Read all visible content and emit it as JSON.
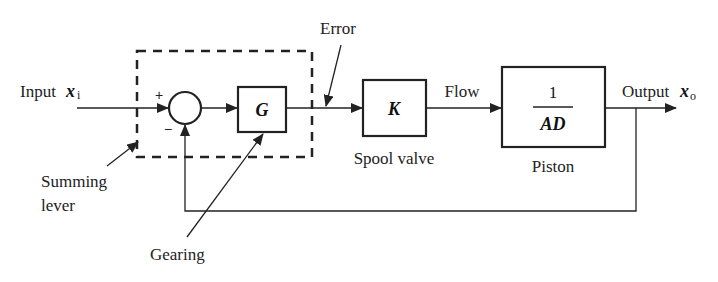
{
  "diagram": {
    "type": "block-diagram",
    "input": {
      "label": "Input",
      "symbol": "x",
      "subscript": "i"
    },
    "output": {
      "label": "Output",
      "symbol": "x",
      "subscript": "o"
    },
    "summing_junction": {
      "plus_sign": "+",
      "minus_sign": "−"
    },
    "blocks": {
      "gearing": {
        "text": "G"
      },
      "spool_valve": {
        "text": "K",
        "caption": "Spool valve"
      },
      "piston": {
        "numerator": "1",
        "denominator": "AD",
        "caption": "Piston"
      }
    },
    "signals": {
      "error": "Error",
      "flow": "Flow"
    },
    "annotations": {
      "summing_lever_line1": "Summing",
      "summing_lever_line2": "lever",
      "gearing": "Gearing"
    },
    "colors": {
      "stroke": "#222222",
      "background": "#ffffff"
    }
  }
}
